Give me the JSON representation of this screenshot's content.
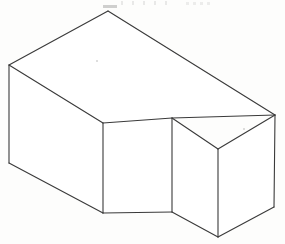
{
  "figure": {
    "title": "",
    "caption": "",
    "type": "isometric-line-drawing",
    "background_color": "#fdfdfc",
    "line_color": "#3a3a3a",
    "line_width": 1.1,
    "canvas": {
      "width": 285,
      "height": 244
    },
    "vertices": {
      "top_back_left": [
        9,
        65
      ],
      "top_apex": [
        108,
        11
      ],
      "top_back_right": [
        275,
        115
      ],
      "notch_top_right": [
        172,
        118
      ],
      "notch_top_left": [
        103,
        123
      ],
      "bottom_front_left": [
        9,
        163
      ],
      "notch_bottom_left": [
        103,
        213
      ],
      "notch_bottom_right": [
        172,
        212
      ],
      "front_center_top": [
        218,
        149
      ],
      "front_center_bottom": [
        218,
        237
      ],
      "bottom_back_right": [
        274,
        207
      ]
    },
    "faces": [
      {
        "name": "top-face",
        "points": "9,65 108,11 275,115 172,118 103,123"
      },
      {
        "name": "left-side-face",
        "points": "9,65 103,123 103,213 9,163"
      },
      {
        "name": "notch-front-face",
        "points": "103,123 172,118 172,212 103,213"
      },
      {
        "name": "notch-right-face",
        "points": "172,118 218,149 218,237 172,212"
      },
      {
        "name": "right-side-face",
        "points": "218,149 275,115 274,207 218,237"
      }
    ],
    "edges": [
      {
        "name": "top-back-left-to-apex",
        "from": [
          9,
          65
        ],
        "to": [
          108,
          11
        ]
      },
      {
        "name": "apex-to-top-back-right",
        "from": [
          108,
          11
        ],
        "to": [
          275,
          115
        ]
      },
      {
        "name": "top-back-right-to-notch-top-right",
        "from": [
          275,
          115
        ],
        "to": [
          172,
          118
        ]
      },
      {
        "name": "notch-top-right-to-notch-top-left",
        "from": [
          172,
          118
        ],
        "to": [
          103,
          123
        ]
      },
      {
        "name": "notch-top-left-to-top-back-left",
        "from": [
          103,
          123
        ],
        "to": [
          9,
          65
        ]
      },
      {
        "name": "left-vertical-edge",
        "from": [
          9,
          65
        ],
        "to": [
          9,
          163
        ]
      },
      {
        "name": "bottom-left-diagonal",
        "from": [
          9,
          163
        ],
        "to": [
          103,
          213
        ]
      },
      {
        "name": "notch-left-vertical-edge",
        "from": [
          103,
          123
        ],
        "to": [
          103,
          213
        ]
      },
      {
        "name": "notch-bottom-edge",
        "from": [
          103,
          213
        ],
        "to": [
          172,
          212
        ]
      },
      {
        "name": "notch-right-vertical-edge",
        "from": [
          172,
          118
        ],
        "to": [
          172,
          212
        ]
      },
      {
        "name": "notch-right-to-front-center-top",
        "from": [
          172,
          118
        ],
        "to": [
          218,
          149
        ]
      },
      {
        "name": "notch-bottom-right-to-front-center-bottom",
        "from": [
          172,
          212
        ],
        "to": [
          218,
          237
        ]
      },
      {
        "name": "front-center-vertical-edge",
        "from": [
          218,
          149
        ],
        "to": [
          218,
          237
        ]
      },
      {
        "name": "front-center-top-to-top-back-right",
        "from": [
          218,
          149
        ],
        "to": [
          275,
          115
        ]
      },
      {
        "name": "right-vertical-edge",
        "from": [
          275,
          115
        ],
        "to": [
          274,
          207
        ]
      },
      {
        "name": "front-center-bottom-to-bottom-back-right",
        "from": [
          218,
          237
        ],
        "to": [
          274,
          207
        ]
      }
    ]
  },
  "chart_data": {
    "type": "line",
    "xlabel": "",
    "ylabel": "",
    "xlim": [
      0,
      285
    ],
    "ylim": [
      244,
      0
    ],
    "grid": false,
    "legend": "none",
    "series": [
      {
        "name": "top-face-outline",
        "x": [
          9,
          108,
          275,
          172,
          103,
          9
        ],
        "y": [
          65,
          11,
          115,
          118,
          123,
          65
        ]
      },
      {
        "name": "left-face-outline",
        "x": [
          9,
          9,
          103,
          103
        ],
        "y": [
          65,
          163,
          213,
          123
        ]
      },
      {
        "name": "notch-front-face-outline",
        "x": [
          103,
          172,
          172,
          103
        ],
        "y": [
          123,
          118,
          212,
          213
        ]
      },
      {
        "name": "notch-right-face-outline",
        "x": [
          172,
          218,
          218,
          172
        ],
        "y": [
          118,
          149,
          237,
          212
        ]
      },
      {
        "name": "right-face-outline",
        "x": [
          218,
          275,
          274,
          218
        ],
        "y": [
          149,
          115,
          207,
          237
        ]
      }
    ]
  }
}
